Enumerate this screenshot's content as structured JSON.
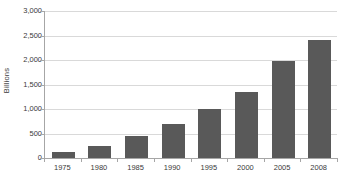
{
  "chart_data": {
    "type": "bar",
    "title": "",
    "xlabel": "",
    "ylabel": "Billions",
    "categories": [
      "1975",
      "1980",
      "1985",
      "1990",
      "1995",
      "2000",
      "2005",
      "2008"
    ],
    "values": [
      130,
      250,
      450,
      700,
      1000,
      1350,
      1980,
      2400
    ],
    "ylim": [
      0,
      3000
    ],
    "yticks": [
      0,
      500,
      1000,
      1500,
      2000,
      2500,
      3000
    ],
    "ytick_labels": [
      "0",
      "500",
      "1,000",
      "1,500",
      "2,000",
      "2,500",
      "3,000"
    ],
    "grid": true,
    "legend": false,
    "series": [
      {
        "name": "Billions",
        "color": "#595959",
        "values": [
          130,
          250,
          450,
          700,
          1000,
          1350,
          1980,
          2400
        ]
      }
    ],
    "colors": {
      "bar": "#595959",
      "gridline": "#d9d9d9",
      "axis": "#a6a6a6",
      "text": "#3a3a3a",
      "background": "#ffffff"
    }
  }
}
